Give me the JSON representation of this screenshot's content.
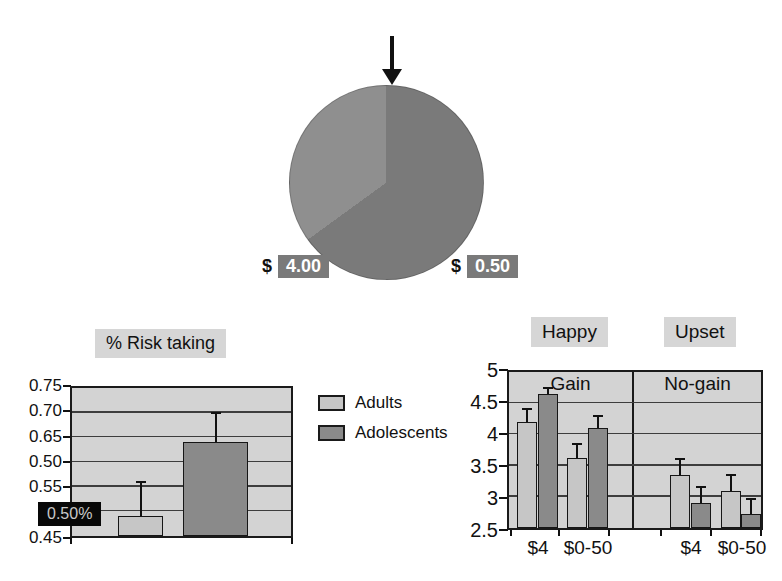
{
  "pie": {
    "left_label": {
      "prefix": "$",
      "value": "4.00"
    },
    "right_label": {
      "prefix": "$",
      "value": "0.50"
    },
    "colors": {
      "light_slice": "#8f8f8f",
      "dark_slice": "#7a7a7a",
      "label_box": "#7a7a7a",
      "label_text": "#ffffff"
    }
  },
  "legend": {
    "items": [
      {
        "label": "Adults",
        "color": "#c6c6c6"
      },
      {
        "label": "Adolescents",
        "color": "#8a8a8a"
      }
    ]
  },
  "risk_chart": {
    "title": "% Risk taking",
    "ytick_rows": [
      {
        "text": "0.75",
        "row": 0
      },
      {
        "text": "0.70",
        "row": 1
      },
      {
        "text": "0.65",
        "row": 2
      },
      {
        "text": "0.50",
        "row": 3
      },
      {
        "text": "0.55",
        "row": 4
      },
      {
        "text": "0.45",
        "row": 6
      }
    ],
    "overlay_label": "0.50%"
  },
  "emotion_chart": {
    "header_left": "Happy",
    "header_right": "Upset",
    "panel_left": "Gain",
    "panel_right": "No-gain",
    "ytick_labels": [
      "5",
      "4.5",
      "4",
      "3.5",
      "3",
      "2.5"
    ],
    "xtick_labels": [
      "$4",
      "$0-50",
      "$4",
      "$0-50"
    ]
  },
  "chart_data": [
    {
      "type": "pie",
      "title": "",
      "slices": [
        {
          "label": "$ 4.00",
          "fraction": 0.35,
          "color": "#8f8f8f"
        },
        {
          "label": "$ 0.50",
          "fraction": 0.65,
          "color": "#7a7a7a"
        }
      ],
      "annotations": [
        "black arrow pointing down at top of wheel (slice boundary at 12 o'clock)"
      ],
      "legend_position": "labels below wheel in gray boxes"
    },
    {
      "type": "bar",
      "title": "% Risk taking",
      "categories": [
        "Adults",
        "Adolescents"
      ],
      "values": [
        0.49,
        0.64
      ],
      "error_up": [
        0.07,
        0.06
      ],
      "ylim": [
        0.45,
        0.75
      ],
      "ytick_labels_printed": [
        "0.75",
        "0.70",
        "0.65",
        "0.50",
        "0.55",
        "0.50%",
        "0.45"
      ],
      "grid": true,
      "note": "printed axis shows 0.50 where 0.60 belongs; 0.50% label is white-on-black box over the 0.50 gridline"
    },
    {
      "type": "bar",
      "headers": [
        "Happy",
        "Upset"
      ],
      "ylim": [
        2.5,
        5
      ],
      "yticks": [
        5,
        4.5,
        4,
        3.5,
        3,
        2.5
      ],
      "grid": true,
      "panels": [
        {
          "label": "Gain",
          "categories": [
            "$4",
            "$0-50"
          ],
          "series": [
            {
              "name": "Adults",
              "values": [
                4.2,
                3.62
              ],
              "errors": [
                0.2,
                0.23
              ]
            },
            {
              "name": "Adolescents",
              "values": [
                4.65,
                4.1
              ],
              "errors": [
                0.1,
                0.2
              ]
            }
          ]
        },
        {
          "label": "No-gain",
          "categories": [
            "$4",
            "$0-50"
          ],
          "series": [
            {
              "name": "Adults",
              "values": [
                3.35,
                3.1
              ],
              "errors": [
                0.25,
                0.25
              ]
            },
            {
              "name": "Adolescents",
              "values": [
                2.9,
                2.72
              ],
              "errors": [
                0.25,
                0.25
              ]
            }
          ]
        }
      ]
    }
  ]
}
